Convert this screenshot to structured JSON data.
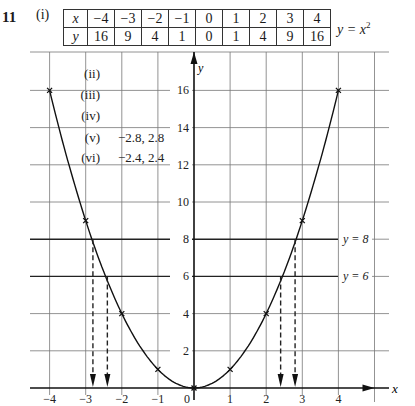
{
  "question": {
    "number": "11",
    "part_i": "(i)",
    "table": {
      "x_header": "x",
      "y_header": "y",
      "x_values": [
        "−4",
        "−3",
        "−2",
        "−1",
        "0",
        "1",
        "2",
        "3",
        "4"
      ],
      "y_values": [
        "16",
        "9",
        "4",
        "1",
        "0",
        "1",
        "4",
        "9",
        "16"
      ]
    },
    "equation_main": "y = x",
    "equation_power": "2",
    "answers": [
      {
        "label": "(ii)",
        "value": ""
      },
      {
        "label": "(iii)",
        "value": ""
      },
      {
        "label": "(iv)",
        "value": ""
      },
      {
        "label": "(v)",
        "value": "−2.8, 2.8"
      },
      {
        "label": "(vi)",
        "value": "−2.4, 2.4"
      }
    ]
  },
  "chart_data": {
    "type": "line",
    "xlabel": "x",
    "ylabel": "y",
    "xlim": [
      -4.5,
      5
    ],
    "ylim": [
      0,
      18
    ],
    "grid": true,
    "x_ticks": [
      "−4",
      "−3",
      "−2",
      "−1",
      "0",
      "1",
      "2",
      "3",
      "4"
    ],
    "y_ticks": [
      "2",
      "4",
      "6",
      "8",
      "10",
      "12",
      "14",
      "16"
    ],
    "series": [
      {
        "name": "y = x^2",
        "x": [
          -4,
          -3,
          -2,
          -1,
          0,
          1,
          2,
          3,
          4
        ],
        "y": [
          16,
          9,
          4,
          1,
          0,
          1,
          4,
          9,
          16
        ],
        "marker": "x"
      }
    ],
    "horizontal_lines": [
      {
        "y": 8,
        "label": "y = 8"
      },
      {
        "y": 6,
        "label": "y = 6"
      }
    ],
    "dashed_arrows_x": [
      -2.8,
      -2.4,
      2.4,
      2.8
    ],
    "annotations": [
      "(v) −2.8, 2.8",
      "(vi) −2.4, 2.4"
    ]
  }
}
